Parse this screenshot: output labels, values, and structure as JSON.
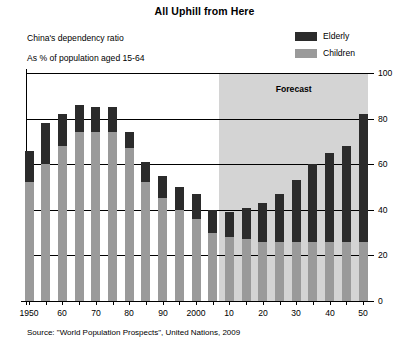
{
  "chart_data": {
    "type": "bar",
    "subtype": "stacked-bar",
    "title": "All Uphill from Here",
    "subtitle_1": "China's dependency ratio",
    "subtitle_2": "As % of population aged 15-64",
    "source": "Source: \"World Population Prospects\", United Nations, 2009",
    "xlabel": "",
    "ylabel": "",
    "ylim": [
      0,
      100
    ],
    "y_ticks": [
      0,
      20,
      40,
      60,
      80,
      100
    ],
    "y_tick_labels": [
      "0",
      "20",
      "40",
      "60",
      "80",
      "100"
    ],
    "grid": true,
    "y_axis_position": "right",
    "legend": [
      {
        "name": "Elderly",
        "color": "#2b2b2b"
      },
      {
        "name": "Children",
        "color": "#9a9a9a"
      }
    ],
    "legend_position": "top-right",
    "annotations": [
      {
        "text": "Forecast",
        "start_year": 2007,
        "end_year": 2052
      }
    ],
    "x": [
      1950,
      1955,
      1960,
      1965,
      1970,
      1975,
      1980,
      1985,
      1990,
      1995,
      2000,
      2005,
      2010,
      2015,
      2020,
      2025,
      2030,
      2035,
      2040,
      2045,
      2050
    ],
    "x_tick_labels": [
      "1950",
      "60",
      "70",
      "80",
      "90",
      "2000",
      "10",
      "20",
      "30",
      "40",
      "50"
    ],
    "x_tick_values": [
      1950,
      1960,
      1970,
      1980,
      1990,
      2000,
      2010,
      2020,
      2030,
      2040,
      2050
    ],
    "series": [
      {
        "name": "Children",
        "color": "#9a9a9a",
        "values": [
          52,
          60,
          68,
          74,
          74,
          74,
          67,
          52,
          45,
          40,
          36,
          30,
          28,
          27,
          26,
          26,
          26,
          26,
          26,
          26,
          26
        ]
      },
      {
        "name": "Elderly",
        "color": "#2b2b2b",
        "values": [
          14,
          18,
          14,
          12,
          11,
          11,
          7,
          9,
          10,
          10,
          11,
          10,
          11,
          14,
          17,
          21,
          27,
          34,
          39,
          42,
          56
        ]
      }
    ],
    "totals": [
      66,
      78,
      82,
      86,
      85,
      85,
      74,
      61,
      55,
      50,
      47,
      40,
      39,
      41,
      43,
      47,
      53,
      60,
      65,
      68,
      82
    ],
    "forecast_start_year": 2007
  }
}
